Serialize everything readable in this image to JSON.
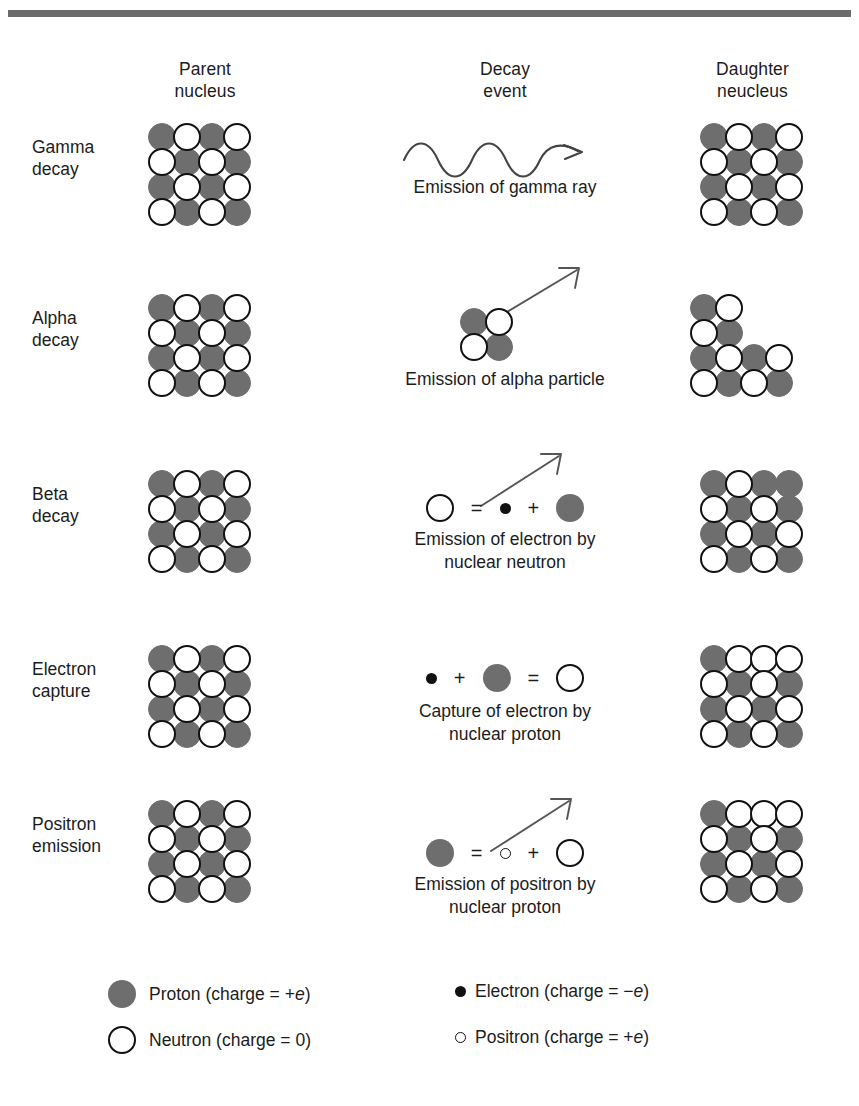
{
  "figure": {
    "colors": {
      "proton_fill": "#6e6e6e",
      "neutron_fill": "#ffffff",
      "neutron_stroke": "#111111",
      "rule": "#6b6b6b",
      "text": "#1c1c1c"
    }
  },
  "headers": {
    "parent": "Parent\nnucleus",
    "event": "Decay\nevent",
    "daughter": "Daughter\nneucleus"
  },
  "rows": [
    {
      "label": "Gamma\ndecay",
      "parent_grid": [
        [
          "p",
          "n",
          "p",
          "n"
        ],
        [
          "n",
          "p",
          "n",
          "p"
        ],
        [
          "p",
          "n",
          "p",
          "n"
        ],
        [
          "n",
          "p",
          "n",
          "p"
        ]
      ],
      "event_kind": "gamma-wave",
      "event_caption": "Emission of gamma ray",
      "daughter_grid": [
        [
          "p",
          "n",
          "p",
          "n"
        ],
        [
          "n",
          "p",
          "n",
          "p"
        ],
        [
          "p",
          "n",
          "p",
          "n"
        ],
        [
          "n",
          "p",
          "n",
          "p"
        ]
      ]
    },
    {
      "label": "Alpha\ndecay",
      "parent_grid": [
        [
          "p",
          "n",
          "p",
          "n"
        ],
        [
          "n",
          "p",
          "n",
          "p"
        ],
        [
          "p",
          "n",
          "p",
          "n"
        ],
        [
          "n",
          "p",
          "n",
          "p"
        ]
      ],
      "event_kind": "alpha-cluster",
      "event_caption": "Emission of alpha particle",
      "daughter_grid": [
        [
          "p",
          "n",
          "",
          ""
        ],
        [
          "n",
          "p",
          "",
          ""
        ],
        [
          "p",
          "n",
          "p",
          "n"
        ],
        [
          "n",
          "p",
          "n",
          "p"
        ]
      ]
    },
    {
      "label": "Beta\ndecay",
      "parent_grid": [
        [
          "p",
          "n",
          "p",
          "n"
        ],
        [
          "n",
          "p",
          "n",
          "p"
        ],
        [
          "p",
          "n",
          "p",
          "n"
        ],
        [
          "n",
          "p",
          "n",
          "p"
        ]
      ],
      "event_kind": "beta-equation",
      "event_equation": [
        "neutron",
        "=",
        "electron",
        "+",
        "proton"
      ],
      "event_caption": "Emission of electron by\nnuclear neutron",
      "daughter_grid": [
        [
          "p",
          "n",
          "p",
          "p"
        ],
        [
          "n",
          "p",
          "n",
          "p"
        ],
        [
          "p",
          "n",
          "p",
          "n"
        ],
        [
          "n",
          "p",
          "n",
          "p"
        ]
      ]
    },
    {
      "label": "Electron\ncapture",
      "parent_grid": [
        [
          "p",
          "n",
          "p",
          "n"
        ],
        [
          "n",
          "p",
          "n",
          "p"
        ],
        [
          "p",
          "n",
          "p",
          "n"
        ],
        [
          "n",
          "p",
          "n",
          "p"
        ]
      ],
      "event_kind": "capture-equation",
      "event_equation": [
        "electron",
        "+",
        "proton",
        "=",
        "neutron"
      ],
      "event_caption": "Capture of electron by\nnuclear proton",
      "daughter_grid": [
        [
          "p",
          "n",
          "n",
          "n"
        ],
        [
          "n",
          "p",
          "n",
          "p"
        ],
        [
          "p",
          "n",
          "p",
          "n"
        ],
        [
          "n",
          "p",
          "n",
          "p"
        ]
      ]
    },
    {
      "label": "Positron\nemission",
      "parent_grid": [
        [
          "p",
          "n",
          "p",
          "n"
        ],
        [
          "n",
          "p",
          "n",
          "p"
        ],
        [
          "p",
          "n",
          "p",
          "n"
        ],
        [
          "n",
          "p",
          "n",
          "p"
        ]
      ],
      "event_kind": "positron-equation",
      "event_equation": [
        "proton",
        "=",
        "positron",
        "+",
        "neutron"
      ],
      "event_caption": "Emission of positron by\nnuclear proton",
      "daughter_grid": [
        [
          "p",
          "n",
          "n",
          "n"
        ],
        [
          "n",
          "p",
          "n",
          "p"
        ],
        [
          "p",
          "n",
          "p",
          "n"
        ],
        [
          "n",
          "p",
          "n",
          "p"
        ]
      ]
    }
  ],
  "legend": {
    "proton": "Proton (charge  =  +e)",
    "neutron": "Neutron (charge  =  0)",
    "electron": "Electron (charge  =  −e)",
    "positron": "Positron (charge  =  +e)"
  }
}
